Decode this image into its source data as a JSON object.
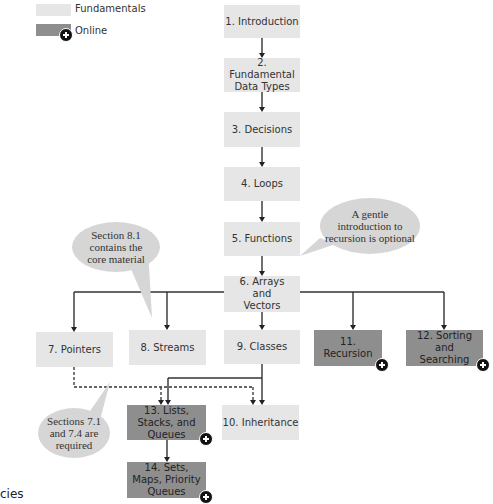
{
  "legend": {
    "fundamentals": {
      "label": "Fundamentals",
      "color": "#e6e6e6"
    },
    "online": {
      "label": "Online",
      "color": "#8e8e8e"
    }
  },
  "nodes": {
    "n1": "1. Introduction",
    "n2": "2. Fundamental Data Types",
    "n3": "3. Decisions",
    "n4": "4. Loops",
    "n5": "5. Functions",
    "n6": "6. Arrays and Vectors",
    "n7": "7. Pointers",
    "n8": "8. Streams",
    "n9": "9. Classes",
    "n10": "10. Inheritance",
    "n11": "11. Recursion",
    "n12": "12. Sorting and Searching",
    "n13": "13. Lists, Stacks, and Queues",
    "n14": "14. Sets, Maps, Priority Queues"
  },
  "notes": {
    "recursion": "A gentle introduction to recursion is optional",
    "streams": "Section 8.1 contains the core material",
    "pointers": "Sections 7.1 and 7.4 are required"
  },
  "caption_fragment": "cies"
}
